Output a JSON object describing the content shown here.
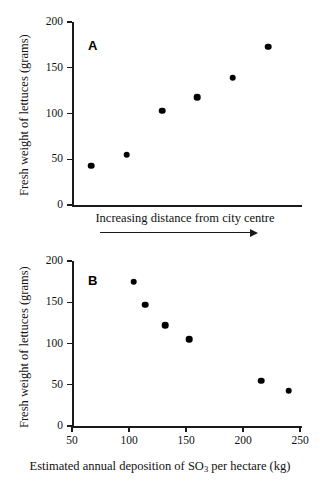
{
  "figure": {
    "background_color": "#ffffff",
    "ink_color": "#1a1a1a",
    "marker_color": "#000000"
  },
  "chart_data": [
    {
      "type": "scatter",
      "panel_label": "A",
      "title": "",
      "xlabel": "Increasing distance from city centre",
      "ylabel": "Fresh weight of lettuces (grams)",
      "ylim": [
        0,
        200
      ],
      "yticks": [
        0,
        50,
        100,
        150,
        200
      ],
      "ytick_labels": [
        "0",
        "50",
        "100",
        "150",
        "200"
      ],
      "xticks": [],
      "xtick_labels": [],
      "x_axis_scaled": false,
      "x_axis_annotation": "arrow pointing right indicating increasing distance",
      "grid": false,
      "legend": false,
      "x": [
        1,
        2,
        3,
        4,
        5,
        6
      ],
      "values": [
        43,
        55,
        103,
        118,
        139,
        173
      ],
      "points": [
        {
          "x": 1,
          "y": 43
        },
        {
          "x": 2,
          "y": 55
        },
        {
          "x": 3,
          "y": 103
        },
        {
          "x": 4,
          "y": 118
        },
        {
          "x": 5,
          "y": 139
        },
        {
          "x": 6,
          "y": 173
        }
      ]
    },
    {
      "type": "scatter",
      "panel_label": "B",
      "title": "",
      "xlabel": "Estimated annual deposition of SO3 per hectare (kg)",
      "xlabel_prefix": "Estimated annual deposition of SO",
      "xlabel_subscript": "3",
      "xlabel_suffix": " per hectare (kg)",
      "ylabel": "Fresh weight of lettuces (grams)",
      "ylim": [
        0,
        200
      ],
      "yticks": [
        0,
        50,
        100,
        150,
        200
      ],
      "ytick_labels": [
        "0",
        "50",
        "100",
        "150",
        "200"
      ],
      "xlim": [
        50,
        250
      ],
      "xticks": [
        50,
        100,
        150,
        200,
        250
      ],
      "xtick_labels": [
        "50",
        "100",
        "150",
        "200",
        "250"
      ],
      "grid": false,
      "legend": false,
      "x": [
        104,
        114,
        132,
        153,
        216,
        240
      ],
      "values": [
        175,
        147,
        122,
        105,
        55,
        43
      ],
      "points": [
        {
          "x": 104,
          "y": 175
        },
        {
          "x": 114,
          "y": 147
        },
        {
          "x": 132,
          "y": 122
        },
        {
          "x": 153,
          "y": 105
        },
        {
          "x": 216,
          "y": 55
        },
        {
          "x": 240,
          "y": 43
        }
      ]
    }
  ]
}
